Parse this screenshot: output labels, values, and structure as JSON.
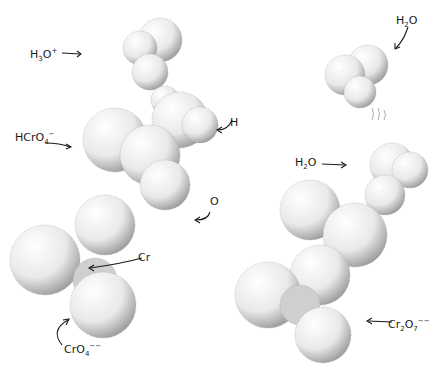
{
  "figure": {
    "left_model": {
      "name": "acid chromate hydrolysis intermediate",
      "labels": {
        "h3o": {
          "base": "H",
          "sub": "3",
          "mid": "O",
          "sup": "+"
        },
        "hcro4": {
          "base": "HCrO",
          "sub": "4",
          "sup": "−"
        },
        "h": {
          "text": "H"
        },
        "o": {
          "text": "O"
        },
        "cr": {
          "text": "Cr"
        },
        "cro4": {
          "base": "CrO",
          "sub": "4",
          "sup": "−−"
        }
      }
    },
    "right_model": {
      "name": "dichromate with water",
      "labels": {
        "h2o_top": {
          "base": "H",
          "sub": "2",
          "mid": "O"
        },
        "h2o_mid": {
          "base": "H",
          "sub": "2",
          "mid": "O"
        },
        "cr2o7": {
          "base": "Cr",
          "sub": "2",
          "mid": "O",
          "sub2": "7",
          "sup": "−−"
        }
      }
    },
    "colors": {
      "ink": "#1a1a1a",
      "paper": "#ffffff",
      "stipple": "#555555"
    }
  }
}
